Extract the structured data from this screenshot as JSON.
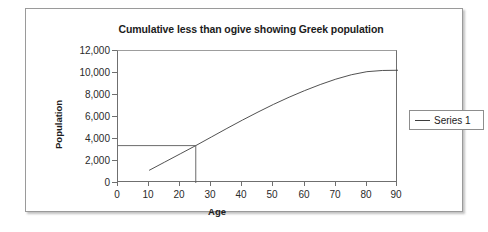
{
  "chart_data": {
    "type": "line",
    "title": "Cumulative less than ogive showing Greek population",
    "xlabel": "Age",
    "ylabel": "Population",
    "xlim": [
      0,
      90
    ],
    "ylim": [
      0,
      12000
    ],
    "xticks": [
      "0",
      "10",
      "20",
      "30",
      "40",
      "50",
      "60",
      "70",
      "80",
      "90"
    ],
    "yticks": [
      "0",
      "2,000",
      "4,000",
      "6,000",
      "8,000",
      "10,000",
      "12,000"
    ],
    "xtick_values": [
      0,
      10,
      20,
      30,
      40,
      50,
      60,
      70,
      80,
      90
    ],
    "ytick_values": [
      0,
      2000,
      4000,
      6000,
      8000,
      10000,
      12000
    ],
    "grid": false,
    "legend_position": "right",
    "series": [
      {
        "name": "Series 1",
        "color": "#3d3d3d",
        "x": [
          10,
          15,
          20,
          25,
          30,
          35,
          40,
          45,
          50,
          55,
          60,
          65,
          70,
          75,
          80,
          85,
          90
        ],
        "values": [
          1150,
          1900,
          2650,
          3400,
          4180,
          4960,
          5720,
          6450,
          7150,
          7800,
          8400,
          8950,
          9440,
          9840,
          10120,
          10230,
          10250
        ]
      }
    ],
    "annotations": [
      {
        "name": "reference-lines",
        "description": "Horizontal line from y-axis to curve at population 3,400 and vertical line down to x-axis at age 25",
        "x": 25,
        "y": 3400
      }
    ]
  },
  "legend": {
    "entries": [
      {
        "label": "Series 1"
      }
    ]
  }
}
